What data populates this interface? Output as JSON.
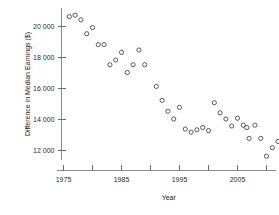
{
  "chart_data": {
    "type": "scatter",
    "title": "",
    "xlabel": "Year",
    "ylabel": "Difference in Median Earnings ($)",
    "xlim": [
      1974,
      2010
    ],
    "ylim": [
      11000,
      21200
    ],
    "grid": false,
    "legend": "none",
    "x_ticks": [
      1975,
      1980,
      1985,
      1990,
      1995,
      2000,
      2005,
      2010
    ],
    "x_tick_labels": [
      "1975",
      "",
      "1985",
      "",
      "1995",
      "",
      "2005",
      ""
    ],
    "y_ticks": [
      12000,
      14000,
      16000,
      18000,
      20000
    ],
    "y_tick_labels": [
      "12 000",
      "14 000",
      "16 000",
      "18 000",
      "20 000"
    ],
    "marker": "open-circle",
    "marker_color": "#4a4a4a",
    "points": [
      {
        "x": 1976,
        "y": 20600
      },
      {
        "x": 1977,
        "y": 20700
      },
      {
        "x": 1978,
        "y": 20400
      },
      {
        "x": 1979,
        "y": 19500
      },
      {
        "x": 1980,
        "y": 19900
      },
      {
        "x": 1981,
        "y": 18800
      },
      {
        "x": 1982,
        "y": 18800
      },
      {
        "x": 1983,
        "y": 17500
      },
      {
        "x": 1984,
        "y": 17800
      },
      {
        "x": 1985,
        "y": 18300
      },
      {
        "x": 1986,
        "y": 17000
      },
      {
        "x": 1987,
        "y": 17500
      },
      {
        "x": 1988,
        "y": 18450
      },
      {
        "x": 1989,
        "y": 17500
      },
      {
        "x": 1991,
        "y": 16100
      },
      {
        "x": 1992,
        "y": 15200
      },
      {
        "x": 1993,
        "y": 14500
      },
      {
        "x": 1994,
        "y": 14000
      },
      {
        "x": 1995,
        "y": 14750
      },
      {
        "x": 1996,
        "y": 13350
      },
      {
        "x": 1997,
        "y": 13150
      },
      {
        "x": 1998,
        "y": 13300
      },
      {
        "x": 1999,
        "y": 13450
      },
      {
        "x": 2000,
        "y": 13250
      },
      {
        "x": 2001,
        "y": 15050
      },
      {
        "x": 2002,
        "y": 14400
      },
      {
        "x": 2003,
        "y": 14000
      },
      {
        "x": 2004,
        "y": 13550
      },
      {
        "x": 2005,
        "y": 14050
      },
      {
        "x": 2006,
        "y": 13600
      },
      {
        "x": 2006.6,
        "y": 13450
      },
      {
        "x": 2007,
        "y": 12750
      },
      {
        "x": 2008,
        "y": 13600
      },
      {
        "x": 2009,
        "y": 12750
      },
      {
        "x": 2010,
        "y": 11600
      },
      {
        "x": 2011,
        "y": 12150
      },
      {
        "x": 2012,
        "y": 12550
      }
    ]
  }
}
